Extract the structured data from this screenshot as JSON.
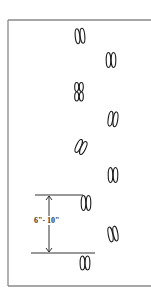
{
  "figure": {
    "frame_color": "#8a8a8a",
    "ink_color": "#1a1a1a"
  },
  "measurement": {
    "label": "6\"- 10\"",
    "top_line_y": 195,
    "bottom_line_y": 253
  },
  "tracks": [
    {
      "id": 1,
      "x": 80,
      "y": 36,
      "rot": -5,
      "split": "top"
    },
    {
      "id": 2,
      "x": 111,
      "y": 60,
      "rot": 0,
      "split": "top"
    },
    {
      "id": 3,
      "x": 79,
      "y": 92,
      "rot": 0,
      "split": "double"
    },
    {
      "id": 4,
      "x": 113,
      "y": 119,
      "rot": 8,
      "split": "top"
    },
    {
      "id": 5,
      "x": 81,
      "y": 147,
      "rot": 25,
      "split": "bottom"
    },
    {
      "id": 6,
      "x": 113,
      "y": 175,
      "rot": 0,
      "split": "top"
    },
    {
      "id": 7,
      "x": 86,
      "y": 203,
      "rot": 0,
      "split": "top"
    },
    {
      "id": 8,
      "x": 113,
      "y": 234,
      "rot": -10,
      "split": "top"
    },
    {
      "id": 9,
      "x": 85,
      "y": 263,
      "rot": 0,
      "split": "bottom"
    }
  ]
}
